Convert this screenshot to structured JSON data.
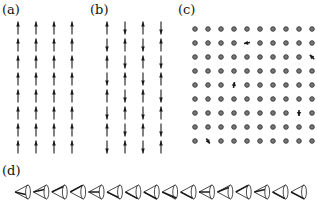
{
  "panels": {
    "a": {
      "label": "(a)",
      "description": "ferromagnetic spin lattice, all spins up",
      "columns": 4,
      "rows": 8,
      "col_x": [
        18,
        36,
        54,
        72
      ],
      "row_y0": 28,
      "row_dy": 17,
      "pattern": "all-up"
    },
    "b": {
      "label": "(b)",
      "description": "antiferromagnetic checkerboard spin lattice",
      "columns": 4,
      "rows": 8,
      "col_x": [
        107,
        125,
        143,
        161
      ],
      "row_y0": 28,
      "row_dy": 17,
      "pattern": "checkerboard"
    },
    "c": {
      "label": "(c)",
      "description": "lattice of sites (dots) with sparse spin defects",
      "columns": 10,
      "rows": 9,
      "x0": 195,
      "dx": 13,
      "y0": 29,
      "dy": 14,
      "defects": [
        {
          "col": 4,
          "row": 1,
          "angle": 190
        },
        {
          "col": 9,
          "row": 2,
          "angle": 135
        },
        {
          "col": 3,
          "row": 4,
          "angle": 80
        },
        {
          "col": 8,
          "row": 6,
          "angle": -90
        },
        {
          "col": 1,
          "row": 8,
          "angle": -55
        }
      ]
    },
    "d": {
      "label": "(d)",
      "description": "row of precessing spins on cones pointing left",
      "count": 16,
      "x0": 22,
      "dx": 18.4,
      "y": 192,
      "phases": [
        200,
        160,
        130,
        110,
        180,
        230,
        250,
        270,
        300,
        240,
        180,
        140,
        110,
        160,
        250,
        280
      ]
    }
  },
  "colors": {
    "ink": "#1a1a1a",
    "dot_fill": "#777777",
    "dot_ring": "#333333",
    "cone_stroke": "#333333"
  }
}
